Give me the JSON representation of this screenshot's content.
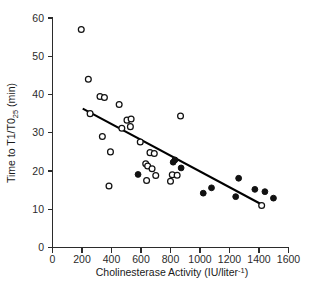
{
  "chart_data": {
    "type": "scatter",
    "title": "",
    "xlabel": "Cholinesterase Activity (IU/liter⁻¹)",
    "xlabel_main": "Cholinesterase Activity (IU/liter",
    "xlabel_sup": "-1",
    "xlabel_tail": ")",
    "ylabel": "Time to T1/T0₂₅ (min)",
    "ylabel_part1": "Time to T1/T0",
    "ylabel_sub": "25",
    "ylabel_part2": " (min)",
    "xlim": [
      0,
      1600
    ],
    "ylim": [
      0,
      60
    ],
    "xticks": [
      0,
      200,
      400,
      600,
      800,
      1000,
      1200,
      1400,
      1600
    ],
    "yticks": [
      0,
      10,
      20,
      30,
      40,
      50,
      60
    ],
    "xtick_labels": [
      "0",
      "200",
      "400",
      "600",
      "800",
      "1000",
      "1200",
      "1400",
      "1600"
    ],
    "ytick_labels": [
      "0",
      "10",
      "20",
      "30",
      "40",
      "50",
      "60"
    ],
    "grid": false,
    "legend": "none",
    "series": [
      {
        "name": "open-circles",
        "marker": "open-circle",
        "color": "#ffffff",
        "edge_color": "#111111",
        "points": [
          [
            195,
            57.0
          ],
          [
            243,
            44.0
          ],
          [
            255,
            35.0
          ],
          [
            322,
            39.5
          ],
          [
            352,
            39.2
          ],
          [
            338,
            29.0
          ],
          [
            383,
            16.1
          ],
          [
            393,
            25.0
          ],
          [
            452,
            37.4
          ],
          [
            470,
            31.2
          ],
          [
            505,
            33.3
          ],
          [
            533,
            33.6
          ],
          [
            528,
            31.6
          ],
          [
            595,
            27.6
          ],
          [
            632,
            21.9
          ],
          [
            645,
            21.3
          ],
          [
            638,
            17.5
          ],
          [
            661,
            24.8
          ],
          [
            675,
            20.6
          ],
          [
            690,
            24.6
          ],
          [
            700,
            18.8
          ],
          [
            800,
            17.3
          ],
          [
            812,
            19.0
          ],
          [
            845,
            18.9
          ],
          [
            868,
            34.4
          ],
          [
            1418,
            11.0
          ]
        ]
      },
      {
        "name": "filled-circles",
        "marker": "filled-circle",
        "color": "#111111",
        "edge_color": "#111111",
        "points": [
          [
            580,
            19.1
          ],
          [
            818,
            22.3
          ],
          [
            830,
            22.9
          ],
          [
            872,
            20.8
          ],
          [
            1022,
            14.2
          ],
          [
            1078,
            15.6
          ],
          [
            1242,
            13.3
          ],
          [
            1262,
            18.1
          ],
          [
            1372,
            15.2
          ],
          [
            1440,
            14.6
          ],
          [
            1498,
            12.9
          ]
        ]
      }
    ],
    "fit_line": {
      "name": "regression-line",
      "color": "#000000",
      "x_start": 205,
      "y_start": 36.3,
      "x_end": 1425,
      "y_end": 11.1
    }
  }
}
